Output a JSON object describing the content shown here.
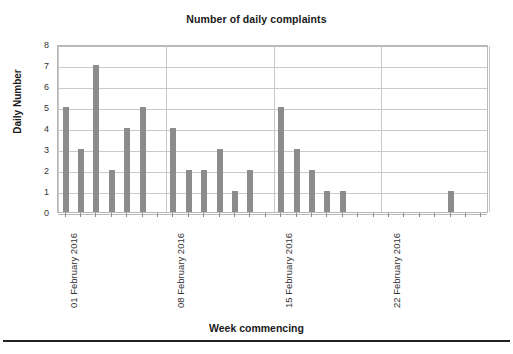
{
  "chart": {
    "title": "Number of daily complaints",
    "xlabel": "Week commencing",
    "ylabel": "Daily Number"
  },
  "y_axis": {
    "ticks": [
      "0",
      "1",
      "2",
      "3",
      "4",
      "5",
      "6",
      "7",
      "8"
    ]
  },
  "x_axis": {
    "ticks": [
      "01 February 2016",
      "08 February 2016",
      "15 February 2016",
      "22 February 2016"
    ]
  },
  "colors": {
    "bar": "#8c8c8c",
    "grid": "#c9c9c9",
    "plot_border": "#b9b9b9",
    "text": "#1a1a1a"
  },
  "chart_data": {
    "type": "bar",
    "title": "Number of daily complaints",
    "xlabel": "Week commencing",
    "ylabel": "Daily Number",
    "ylim": [
      0,
      8
    ],
    "ytick_step": 1,
    "grid": true,
    "legend": "none",
    "categories": [
      "01 February 2016",
      "02 February 2016",
      "03 February 2016",
      "04 February 2016",
      "05 February 2016",
      "06 February 2016",
      "07 February 2016",
      "08 February 2016",
      "09 February 2016",
      "10 February 2016",
      "11 February 2016",
      "12 February 2016",
      "13 February 2016",
      "14 February 2016",
      "15 February 2016",
      "16 February 2016",
      "17 February 2016",
      "18 February 2016",
      "19 February 2016",
      "20 February 2016",
      "21 February 2016",
      "22 February 2016",
      "23 February 2016",
      "24 February 2016",
      "25 February 2016",
      "26 February 2016",
      "27 February 2016",
      "28 February 2016"
    ],
    "values": [
      5,
      3,
      7,
      2,
      4,
      5,
      0,
      4,
      2,
      2,
      3,
      1,
      2,
      0,
      5,
      3,
      2,
      1,
      1,
      0,
      0,
      0,
      0,
      0,
      0,
      1,
      0,
      0
    ],
    "x_tick_labels_shown": [
      "01 February 2016",
      "08 February 2016",
      "15 February 2016",
      "22 February 2016"
    ],
    "x_tick_label_rotation": -90
  }
}
